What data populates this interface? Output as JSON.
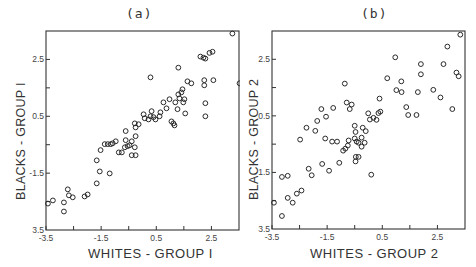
{
  "chart_data": [
    {
      "type": "scatter",
      "title": "(a)",
      "xlabel": "WHITES - GROUP I",
      "ylabel": "BLACKS - GROUP I",
      "xlim": [
        -3.5,
        3.5
      ],
      "ylim": [
        -3.5,
        3.5
      ],
      "x_ticks_labeled": [
        "-3.5",
        "-1.5",
        "0.5",
        "2.5"
      ],
      "y_ticks_labeled": [
        "3.5",
        "-1.5",
        "0.5",
        "2.5"
      ],
      "x_ticks_minor": [
        -2.5,
        -0.5,
        1.5
      ],
      "y_ticks_minor": [
        -2.5,
        -0.5,
        1.5
      ],
      "grid": false,
      "marker": "open-circle",
      "points": [
        [
          -3.43,
          -2.57
        ],
        [
          -3.25,
          -2.46
        ],
        [
          -2.85,
          -2.53
        ],
        [
          -2.85,
          -2.85
        ],
        [
          -2.71,
          -2.07
        ],
        [
          -2.67,
          -2.28
        ],
        [
          -2.53,
          -2.35
        ],
        [
          -2.1,
          -2.32
        ],
        [
          -1.99,
          -2.25
        ],
        [
          -1.66,
          -1.86
        ],
        [
          -1.66,
          -1.05
        ],
        [
          -1.55,
          -1.44
        ],
        [
          -1.52,
          -0.69
        ],
        [
          -1.19,
          -1.51
        ],
        [
          -1.37,
          -0.48
        ],
        [
          -1.26,
          -0.48
        ],
        [
          -1.15,
          -0.48
        ],
        [
          -1.08,
          -0.45
        ],
        [
          -0.97,
          -0.38
        ],
        [
          -0.86,
          -0.77
        ],
        [
          -0.75,
          -0.77
        ],
        [
          -0.64,
          -0.59
        ],
        [
          -0.61,
          -0.34
        ],
        [
          -0.61,
          -0.02
        ],
        [
          -0.54,
          -0.55
        ],
        [
          -0.47,
          -0.52
        ],
        [
          -0.39,
          -0.87
        ],
        [
          -0.39,
          -0.38
        ],
        [
          -0.25,
          -0.87
        ],
        [
          -0.28,
          -0.59
        ],
        [
          -0.25,
          -0.2
        ],
        [
          -0.25,
          0.11
        ],
        [
          -0.28,
          0.25
        ],
        [
          -0.14,
          0.22
        ],
        [
          0.04,
          0.57
        ],
        [
          0.08,
          0.43
        ],
        [
          0.22,
          0.39
        ],
        [
          0.29,
          0.5
        ],
        [
          0.33,
          0.68
        ],
        [
          0.4,
          0.47
        ],
        [
          0.47,
          0.39
        ],
        [
          0.62,
          0.5
        ],
        [
          0.65,
          0.64
        ],
        [
          0.76,
          0.99
        ],
        [
          0.87,
          0.78
        ],
        [
          0.98,
          1.1
        ],
        [
          1.05,
          0.32
        ],
        [
          1.12,
          0.25
        ],
        [
          1.16,
          0.18
        ],
        [
          1.19,
          0.99
        ],
        [
          1.27,
          0.75
        ],
        [
          1.34,
          1.13
        ],
        [
          1.3,
          1.27
        ],
        [
          1.41,
          1.34
        ],
        [
          1.52,
          1.1
        ],
        [
          1.77,
          1.66
        ],
        [
          1.3,
          2.21
        ],
        [
          1.48,
          0.99
        ],
        [
          1.45,
          1.45
        ],
        [
          1.55,
          0.6
        ],
        [
          1.63,
          1.73
        ],
        [
          0.29,
          1.87
        ],
        [
          2.24,
          1.59
        ],
        [
          2.28,
          0.5
        ],
        [
          2.28,
          0.96
        ],
        [
          2.1,
          2.6
        ],
        [
          2.21,
          2.56
        ],
        [
          2.43,
          2.73
        ],
        [
          2.28,
          2.53
        ],
        [
          2.54,
          2.77
        ],
        [
          3.26,
          3.41
        ],
        [
          3.52,
          1.66
        ],
        [
          2.57,
          1.77
        ],
        [
          2.24,
          1.77
        ]
      ]
    },
    {
      "type": "scatter",
      "title": "(b)",
      "xlabel": "WHITES - GROUP 2",
      "ylabel": "BLACKS - GROUP 2",
      "xlim": [
        -3.5,
        3.5
      ],
      "ylim": [
        -3.5,
        3.5
      ],
      "x_ticks_labeled": [
        "-3.5",
        "-1.5",
        "0.5",
        "2.5"
      ],
      "y_ticks_labeled": [
        "3.5",
        "1.5",
        "0.5",
        "2.5"
      ],
      "x_ticks_minor": [
        -2.5,
        -0.5,
        1.5
      ],
      "y_ticks_minor": [
        -2.5,
        -0.5,
        1.5
      ],
      "grid": false,
      "marker": "open-circle",
      "points": [
        [
          -3.43,
          -2.57
        ],
        [
          -3.14,
          -3.04
        ],
        [
          -3.14,
          -1.66
        ],
        [
          -2.93,
          -1.62
        ],
        [
          -2.93,
          -2.4
        ],
        [
          -2.75,
          -2.57
        ],
        [
          -2.6,
          -2.25
        ],
        [
          -2.43,
          -2.14
        ],
        [
          -2.17,
          -1.37
        ],
        [
          -2.06,
          -1.6
        ],
        [
          -1.68,
          -1.2
        ],
        [
          -1.43,
          -1.44
        ],
        [
          -1.06,
          -1.16
        ],
        [
          -1.32,
          -0.41
        ],
        [
          -1.14,
          -0.41
        ],
        [
          -0.92,
          -0.73
        ],
        [
          -0.84,
          -0.66
        ],
        [
          -0.75,
          -0.55
        ],
        [
          -0.72,
          -0.37
        ],
        [
          -0.5,
          -0.3
        ],
        [
          -0.43,
          -0.41
        ],
        [
          -0.36,
          -0.45
        ],
        [
          -0.25,
          -0.59
        ],
        [
          -0.46,
          -0.95
        ],
        [
          -0.36,
          -0.95
        ],
        [
          -0.47,
          -1.11
        ],
        [
          -0.14,
          -0.45
        ],
        [
          -0.25,
          -0.27
        ],
        [
          -0.5,
          0.15
        ],
        [
          -0.47,
          -0.07
        ],
        [
          -0.21,
          0.08
        ],
        [
          -0.1,
          -0.04
        ],
        [
          0.05,
          0.37
        ],
        [
          -0.01,
          0.59
        ],
        [
          0.18,
          0.43
        ],
        [
          0.29,
          0.36
        ],
        [
          0.36,
          0.6
        ],
        [
          0.43,
          0.65
        ],
        [
          -0.68,
          0.74
        ],
        [
          -0.61,
          0.9
        ],
        [
          -0.79,
          0.97
        ],
        [
          0.4,
          1.11
        ],
        [
          0.68,
          1.83
        ],
        [
          0.97,
          2.57
        ],
        [
          1.01,
          1.41
        ],
        [
          1.2,
          1.34
        ],
        [
          1.19,
          1.72
        ],
        [
          1.37,
          0.81
        ],
        [
          1.44,
          0.53
        ],
        [
          1.74,
          0.53
        ],
        [
          1.79,
          1.34
        ],
        [
          1.9,
          1.97
        ],
        [
          1.9,
          2.33
        ],
        [
          2.35,
          1.42
        ],
        [
          2.61,
          1.15
        ],
        [
          2.72,
          2.33
        ],
        [
          2.86,
          2.95
        ],
        [
          3.19,
          2.03
        ],
        [
          3.04,
          0.74
        ],
        [
          3.33,
          3.37
        ],
        [
          3.27,
          1.9
        ],
        [
          0.1,
          -1.58
        ],
        [
          -0.86,
          1.64
        ],
        [
          -1.28,
          0.78
        ],
        [
          -1.54,
          0.47
        ],
        [
          -1.86,
          0.32
        ],
        [
          -1.71,
          0.74
        ],
        [
          -1.57,
          -0.3
        ],
        [
          -2.25,
          0.08
        ],
        [
          -1.93,
          -0.03
        ],
        [
          -2.48,
          -0.34
        ]
      ]
    }
  ],
  "panels": {
    "a": {
      "title": "(a)",
      "xlabel": "WHITES - GROUP I",
      "ylabel": "BLACKS - GROUP I",
      "xticks": [
        "-3.5",
        "-1.5",
        "0.5",
        "2.5"
      ],
      "yticks": [
        "2.5",
        "0.5",
        "-1.5",
        "3.5"
      ]
    },
    "b": {
      "title": "(b)",
      "xlabel": "WHITES - GROUP 2",
      "ylabel": "BLACKS - GROUP 2",
      "xticks": [
        "-3.5",
        "-1.5",
        "0.5",
        "2.5"
      ],
      "yticks": [
        "2.5",
        "0.5",
        "1.5",
        "3.5"
      ]
    }
  }
}
